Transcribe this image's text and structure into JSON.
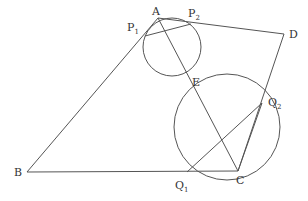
{
  "diagram": {
    "type": "geometry",
    "points": {
      "A": {
        "label": "A",
        "x": 158,
        "y": 18
      },
      "P1": {
        "label": "P",
        "sub": "1",
        "x": 145,
        "y": 36
      },
      "P2": {
        "label": "P",
        "sub": "2",
        "x": 191,
        "y": 24
      },
      "D": {
        "label": "D",
        "x": 284,
        "y": 34
      },
      "E": {
        "label": "E",
        "x": 188,
        "y": 76
      },
      "B": {
        "label": "B",
        "x": 27,
        "y": 172
      },
      "Q1": {
        "label": "Q",
        "sub": "1",
        "x": 187,
        "y": 172
      },
      "C": {
        "label": "C",
        "x": 238,
        "y": 171
      },
      "Q2": {
        "label": "Q",
        "sub": "2",
        "x": 262,
        "y": 103
      }
    },
    "circles": [
      {
        "name": "small-circle",
        "cx": 172,
        "cy": 47,
        "r": 29
      },
      {
        "name": "large-circle",
        "cx": 227,
        "cy": 127,
        "r": 53
      }
    ],
    "segments": [
      [
        "B",
        "A"
      ],
      [
        "A",
        "D"
      ],
      [
        "D",
        "C"
      ],
      [
        "B",
        "C"
      ],
      [
        "A",
        "C"
      ],
      [
        "P1",
        "P2"
      ],
      [
        "Q1",
        "Q2"
      ],
      [
        "Q2",
        "C"
      ]
    ]
  }
}
